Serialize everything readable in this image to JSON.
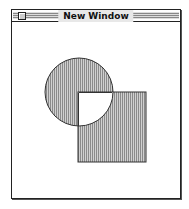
{
  "window": {
    "title": "New Window"
  },
  "drawing": {
    "fill_color": "#b8b8b8",
    "stroke_color": "#333333",
    "shapes": [
      {
        "kind": "circle",
        "label": "circle"
      },
      {
        "kind": "square",
        "label": "square"
      }
    ]
  }
}
